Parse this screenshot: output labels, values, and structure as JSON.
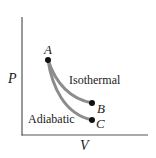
{
  "diagram": {
    "type": "PV diagram",
    "axes": {
      "x_label": "V",
      "y_label": "P"
    },
    "points": [
      {
        "id": "A",
        "label": "A"
      },
      {
        "id": "B",
        "label": "B"
      },
      {
        "id": "C",
        "label": "C"
      }
    ],
    "curves": [
      {
        "id": "isothermal",
        "label": "Isothermal",
        "from": "A",
        "to": "B"
      },
      {
        "id": "adiabatic",
        "label": "Adiabatic",
        "from": "A",
        "to": "C"
      }
    ],
    "colors": {
      "axis": "#555555",
      "curve": "#8c8c8c",
      "point": "#111111",
      "text": "#1a1a1a"
    }
  }
}
